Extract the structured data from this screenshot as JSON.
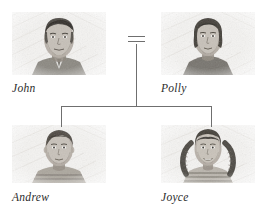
{
  "diagram": {
    "type": "family-tree",
    "title": "",
    "nodes": [
      {
        "id": "john",
        "label": "John",
        "role": "father",
        "generation": 1,
        "portrait": "pencil-sketch-portrait-adult-male",
        "photo": {
          "x": 12,
          "y": 12,
          "w": 94,
          "h": 63
        },
        "label_pos": {
          "x": 12,
          "y": 83
        }
      },
      {
        "id": "polly",
        "label": "Polly",
        "role": "mother",
        "generation": 1,
        "portrait": "pencil-sketch-portrait-adult-female",
        "photo": {
          "x": 161,
          "y": 12,
          "w": 94,
          "h": 63
        },
        "label_pos": {
          "x": 161,
          "y": 83
        }
      },
      {
        "id": "andrew",
        "label": "Andrew",
        "role": "son",
        "generation": 2,
        "portrait": "pencil-sketch-portrait-boy",
        "photo": {
          "x": 12,
          "y": 125,
          "w": 94,
          "h": 58
        },
        "label_pos": {
          "x": 12,
          "y": 192
        }
      },
      {
        "id": "joyce",
        "label": "Joyce",
        "role": "daughter",
        "generation": 2,
        "portrait": "pencil-sketch-portrait-girl-with-braids",
        "photo": {
          "x": 161,
          "y": 125,
          "w": 94,
          "h": 58
        },
        "label_pos": {
          "x": 161,
          "y": 192
        }
      }
    ],
    "links": [
      {
        "id": "marriage",
        "kind": "marriage-equals-sign",
        "from": "john",
        "to": "polly",
        "symbol": "="
      },
      {
        "id": "descent",
        "kind": "descent-line",
        "from": "marriage",
        "to": [
          "andrew",
          "joyce"
        ]
      }
    ],
    "colors": {
      "line": "#6f6f6f",
      "label_text": "#2b2b2b",
      "background": "#ffffff",
      "photo_paper": "#f2f1ef",
      "pencil_dark": "#3a3734",
      "pencil_mid": "#6d6861",
      "pencil_light": "#a9a39b"
    }
  }
}
